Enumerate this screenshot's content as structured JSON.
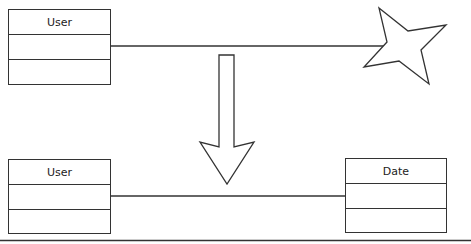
{
  "diagram": {
    "type": "uml-class-transformation",
    "stroke_color": "#333333",
    "top": {
      "class_box": {
        "name": "User",
        "sections": [
          "User",
          "",
          ""
        ]
      },
      "connector": "line",
      "target": {
        "shape": "star-icon",
        "label": ""
      }
    },
    "transform_arrow": {
      "direction": "down",
      "label": ""
    },
    "bottom": {
      "left_class": {
        "name": "User",
        "sections": [
          "User",
          "",
          ""
        ]
      },
      "right_class": {
        "name": "Date",
        "sections": [
          "Date",
          "",
          ""
        ]
      },
      "connector": "line"
    }
  }
}
